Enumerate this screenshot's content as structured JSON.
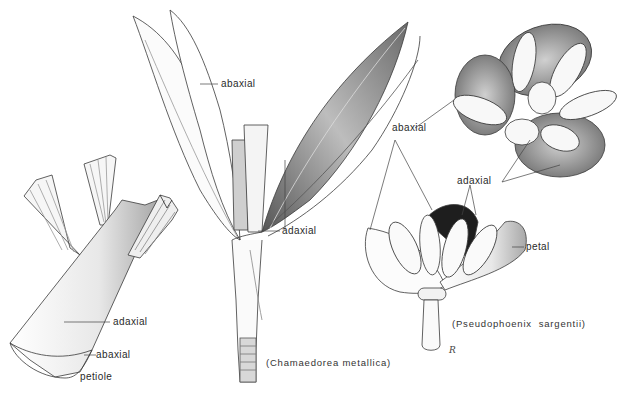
{
  "figure": {
    "type": "botanical-illustration",
    "subjects": [
      {
        "id": "petiole-detail",
        "caption": ""
      },
      {
        "id": "chamaedorea",
        "caption": "(Chamaedorea metallica)"
      },
      {
        "id": "pseudophoenix",
        "caption": "(Pseudophoenix  sargentii)"
      }
    ],
    "labels": {
      "petiole_adaxial": "adaxial",
      "petiole_abaxial": "abaxial",
      "petiole": "petiole",
      "leaf_abaxial": "abaxial",
      "leaf_adaxial": "adaxial",
      "flower_abaxial": "abaxial",
      "flower_adaxial": "adaxial",
      "petal": "petal"
    },
    "captions": {
      "chamaedorea": "(Chamaedorea metallica)",
      "pseudophoenix": "(Pseudophoenix  sargentii)"
    },
    "signature": "R"
  },
  "colors": {
    "line": "#3a3a3a",
    "shade": "#9a9a9a",
    "dark": "#1e1e1e",
    "background": "#ffffff"
  }
}
